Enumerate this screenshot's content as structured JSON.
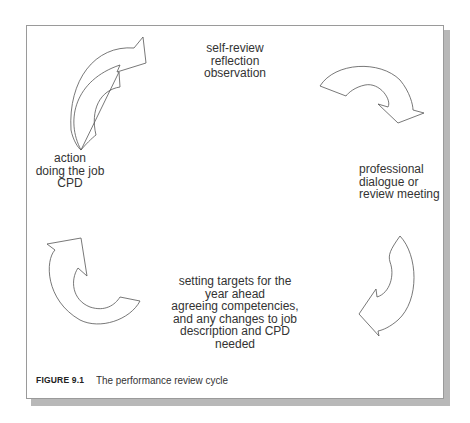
{
  "figure": {
    "label": "FIGURE 9.1",
    "title": "The performance review cycle"
  },
  "stages": {
    "top": [
      "self-review",
      "reflection",
      "observation"
    ],
    "right": [
      "professional",
      "dialogue or",
      "review meeting"
    ],
    "bottom": [
      "setting targets for the",
      "year ahead",
      "agreeing competencies,",
      "and any changes to job",
      "description and CPD",
      "needed"
    ],
    "left": [
      "action",
      "doing the job",
      "CPD"
    ]
  },
  "arrows": [
    "top-left-clockwise-arrow",
    "top-right-clockwise-arrow",
    "bottom-right-clockwise-arrow",
    "bottom-left-clockwise-arrow"
  ],
  "colors": {
    "frame_border": "#9a9a9a",
    "shadow": "#b8b8b8",
    "arrow_stroke": "#555555",
    "text": "#333333"
  }
}
